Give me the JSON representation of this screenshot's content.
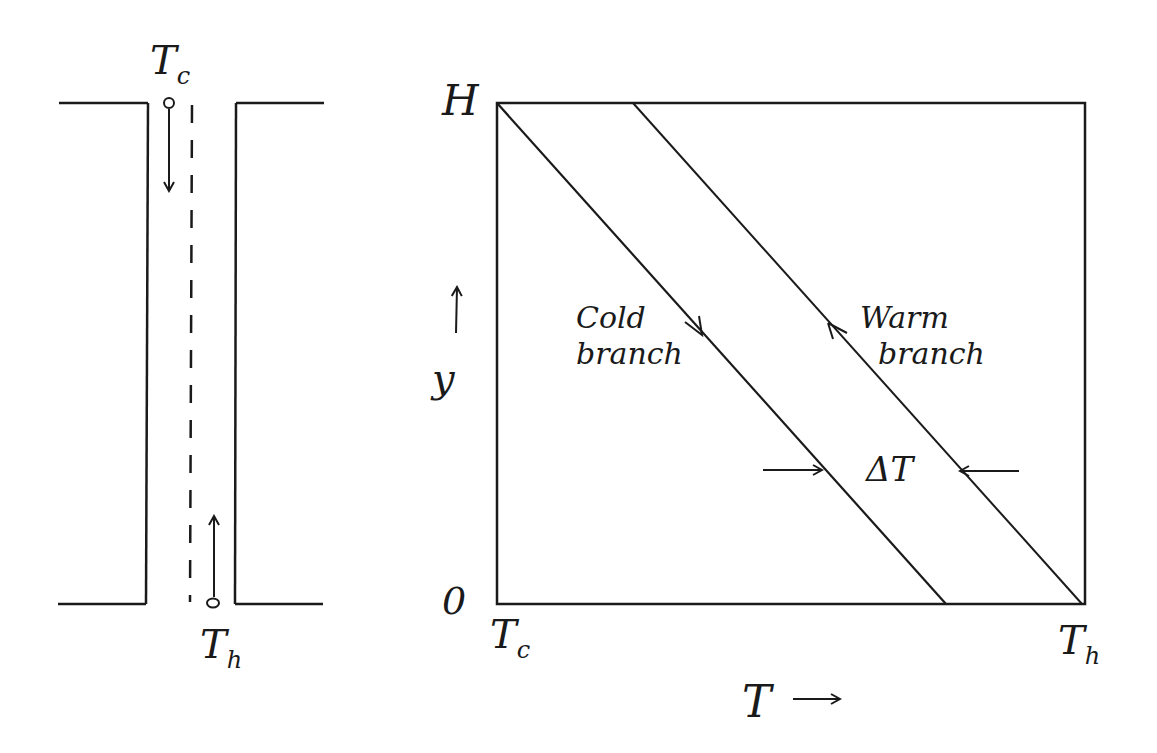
{
  "schematic": {
    "top_label": {
      "main": "T",
      "sub": "c"
    },
    "bottom_label": {
      "main": "T",
      "sub": "h"
    },
    "flow_top": "down",
    "flow_bottom": "up"
  },
  "chart": {
    "y_top_label": "H",
    "y_bottom_label": "0",
    "y_axis_label": "y",
    "y_axis_arrow": "↑",
    "x_left_label": {
      "main": "T",
      "sub": "c"
    },
    "x_right_label": {
      "main": "T",
      "sub": "h"
    },
    "x_axis_label": "T",
    "x_axis_arrow": "→",
    "cold_branch": {
      "line1": "Cold",
      "line2": "branch"
    },
    "warm_branch": {
      "line1": "Warm",
      "line2": "branch"
    },
    "delta_label": "ΔT"
  },
  "colors": {
    "ink": "#1a1a1a",
    "background": "#ffffff"
  }
}
